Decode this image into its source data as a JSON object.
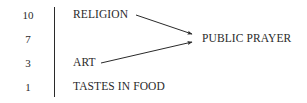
{
  "diagram": {
    "rows": [
      {
        "value": "10",
        "label": "RELIGION"
      },
      {
        "value": "7",
        "label": ""
      },
      {
        "value": "3",
        "label": "ART"
      },
      {
        "value": "1",
        "label": "TASTES IN FOOD"
      }
    ],
    "target": {
      "label": "PUBLIC PRAYER"
    },
    "arrows": [
      {
        "from": "RELIGION",
        "to": "PUBLIC PRAYER"
      },
      {
        "from": "ART",
        "to": "PUBLIC PRAYER"
      }
    ],
    "colors": {
      "ink": "#2a2a2a",
      "background": "#ffffff"
    }
  }
}
